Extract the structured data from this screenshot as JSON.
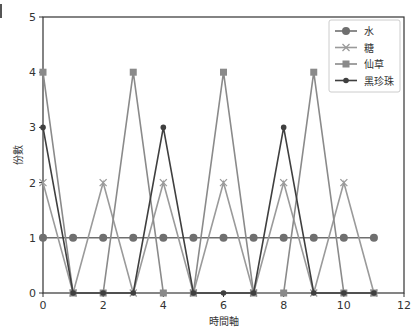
{
  "chart_data": {
    "type": "line",
    "title": "",
    "xlabel": "時間軸",
    "ylabel": "份數",
    "xlim": [
      0,
      12
    ],
    "ylim": [
      0,
      5
    ],
    "xticks": [
      0,
      2,
      4,
      6,
      8,
      10,
      12
    ],
    "yticks": [
      0,
      1,
      2,
      3,
      4,
      5
    ],
    "grid": false,
    "legend_position": "upper right",
    "x": [
      0,
      1,
      2,
      3,
      4,
      5,
      6,
      7,
      8,
      9,
      10,
      11
    ],
    "series": [
      {
        "name": "水",
        "marker": "circle",
        "color": "#6f6f6f",
        "values": [
          1,
          1,
          1,
          1,
          1,
          1,
          1,
          1,
          1,
          1,
          1,
          1
        ]
      },
      {
        "name": "糖",
        "marker": "x",
        "color": "#9a9a9a",
        "values": [
          2,
          0,
          2,
          0,
          2,
          0,
          2,
          0,
          2,
          0,
          2,
          0
        ]
      },
      {
        "name": "仙草",
        "marker": "square",
        "color": "#8a8a8a",
        "values": [
          4,
          0,
          0,
          4,
          0,
          0,
          4,
          0,
          0,
          4,
          0,
          0
        ]
      },
      {
        "name": "黑珍珠",
        "marker": "dot",
        "color": "#3f3f3f",
        "values": [
          3,
          0,
          0,
          0,
          3,
          0,
          0,
          0,
          3,
          0,
          0,
          0
        ]
      }
    ]
  }
}
